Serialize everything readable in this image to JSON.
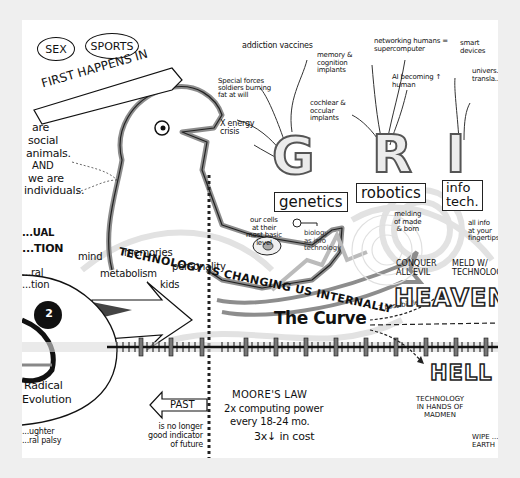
{
  "banner": {
    "bubbles": [
      "SEX",
      "SPORTS"
    ],
    "ribbon": "FIRST HAPPENS IN"
  },
  "left_notes": {
    "social": [
      "are",
      "social",
      "animals.",
      "AND",
      "we are",
      "individuals."
    ],
    "partial_left": [
      "...UAL",
      "...TION"
    ],
    "partial_left2": [
      "...ral",
      "...tion"
    ],
    "radical": [
      "Radical",
      "Evolution"
    ],
    "bottom_left": [
      "...ughter",
      "...ral palsy"
    ],
    "number_badge": "2"
  },
  "grit": {
    "genetics": {
      "letter": "G",
      "label": "genetics",
      "annotations": [
        "addiction vaccines",
        "Special forces soldiers burning fat at will",
        "X energy crisis"
      ],
      "sub_left": [
        "our cells",
        "at their",
        "most basic",
        "level"
      ],
      "sub_right": [
        "biology",
        "as info",
        "technology"
      ]
    },
    "robotics": {
      "letter": "R",
      "label": "robotics",
      "annotations": [
        "memory & cognition implants",
        "cochlear & occular implants",
        "networking humans = supercomputer",
        "AI becoming ↑ human"
      ],
      "sub": [
        "melding",
        "of made",
        "& born"
      ]
    },
    "infotech": {
      "letter": "I",
      "label_lines": [
        "info",
        "tech."
      ],
      "annotations": [
        "smart devices",
        "univers... transla..."
      ],
      "sub": [
        "all info",
        "at your",
        "fingertips"
      ]
    }
  },
  "main_banner": "TECHNOLOGY IS CHANGING US INTERNALLY",
  "internal_bubbles": [
    "mind",
    "memories",
    "metabolism",
    "personality",
    "kids"
  ],
  "curve": {
    "title": "The Curve",
    "possibilities_label": "3 possibilities:",
    "heaven": "HEAVEN",
    "heaven_notes": [
      "CONQUER ALL EVIL",
      "MELD W/ TECHNOLOGY"
    ],
    "hell": "HELL",
    "hell_notes": [
      "TECHNOLOGY IN HANDS OF MADMEN",
      "WIPE ... EARTH"
    ]
  },
  "past": {
    "label": "PAST",
    "note": [
      "is no longer",
      "good indicator",
      "of future"
    ]
  },
  "moores_law": {
    "title": "MOORE'S LAW",
    "lines": [
      "2x computing power",
      "every 18-24 mo.",
      "3x↓ in cost"
    ]
  },
  "colors": {
    "page_bg": "#efefef",
    "card_bg": "#ffffff",
    "ink": "#111111",
    "gray_marker": "#9a9a9a",
    "light_gray": "#d6d6d6"
  }
}
